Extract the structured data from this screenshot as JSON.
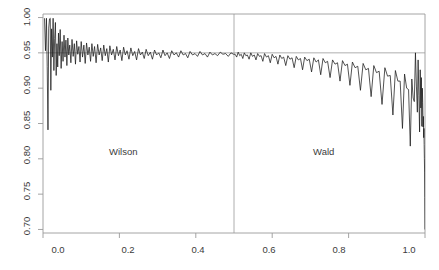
{
  "chart_data": {
    "type": "line",
    "title": "",
    "subtitle": "",
    "xlabel": "",
    "ylabel": "",
    "xlim": [
      0.0,
      1.0
    ],
    "ylim": [
      0.695,
      1.005
    ],
    "grid": false,
    "legend_position": "none",
    "xticks": [
      0.0,
      0.2,
      0.4,
      0.6,
      0.8,
      1.0
    ],
    "xtick_labels": [
      "0.0",
      "0.2",
      "0.4",
      "0.6",
      "0.8",
      "1.0"
    ],
    "yticks": [
      0.7,
      0.75,
      0.8,
      0.85,
      0.9,
      0.95,
      1.0
    ],
    "ytick_labels": [
      "0.70",
      "0.75",
      "0.80",
      "0.85",
      "0.90",
      "0.95",
      "1.00"
    ],
    "reference_lines": [
      {
        "orientation": "horizontal",
        "value": 0.95,
        "color": "#999999"
      },
      {
        "orientation": "vertical",
        "value": 0.5,
        "color": "#999999"
      }
    ],
    "annotations": [
      {
        "text": "Wilson",
        "x": 0.21,
        "y": 0.805
      },
      {
        "text": "Wald",
        "x": 0.735,
        "y": 0.805
      }
    ],
    "series": [
      {
        "name": "coverage",
        "color": "#1a1a1a",
        "x": [
          0.004,
          0.0065,
          0.009,
          0.011,
          0.013,
          0.015,
          0.017,
          0.019,
          0.0205,
          0.0225,
          0.0245,
          0.0265,
          0.0285,
          0.0305,
          0.0325,
          0.0345,
          0.0365,
          0.0385,
          0.0405,
          0.0425,
          0.045,
          0.0475,
          0.05,
          0.0525,
          0.055,
          0.0575,
          0.06,
          0.0625,
          0.065,
          0.0675,
          0.07,
          0.073,
          0.076,
          0.079,
          0.082,
          0.085,
          0.088,
          0.091,
          0.094,
          0.097,
          0.1,
          0.1035,
          0.107,
          0.1105,
          0.114,
          0.1175,
          0.121,
          0.1245,
          0.128,
          0.1315,
          0.135,
          0.139,
          0.143,
          0.147,
          0.151,
          0.155,
          0.159,
          0.163,
          0.167,
          0.171,
          0.175,
          0.1795,
          0.184,
          0.1885,
          0.193,
          0.1975,
          0.202,
          0.2065,
          0.211,
          0.2155,
          0.22,
          0.225,
          0.23,
          0.235,
          0.24,
          0.245,
          0.25,
          0.255,
          0.26,
          0.265,
          0.27,
          0.2755,
          0.281,
          0.2865,
          0.292,
          0.2975,
          0.303,
          0.3085,
          0.314,
          0.3195,
          0.325,
          0.331,
          0.337,
          0.343,
          0.349,
          0.355,
          0.361,
          0.367,
          0.373,
          0.379,
          0.385,
          0.3915,
          0.398,
          0.4045,
          0.411,
          0.4175,
          0.424,
          0.4305,
          0.437,
          0.4435,
          0.45,
          0.457,
          0.464,
          0.471,
          0.478,
          0.485,
          0.492,
          0.499,
          0.503,
          0.507,
          0.511,
          0.515,
          0.519,
          0.523,
          0.527,
          0.531,
          0.535,
          0.5395,
          0.544,
          0.5485,
          0.553,
          0.5575,
          0.562,
          0.5665,
          0.571,
          0.5755,
          0.58,
          0.585,
          0.59,
          0.595,
          0.6,
          0.605,
          0.61,
          0.615,
          0.62,
          0.625,
          0.63,
          0.6355,
          0.641,
          0.6465,
          0.652,
          0.6575,
          0.663,
          0.6685,
          0.674,
          0.6795,
          0.685,
          0.691,
          0.697,
          0.703,
          0.709,
          0.715,
          0.721,
          0.727,
          0.733,
          0.739,
          0.745,
          0.7515,
          0.758,
          0.7645,
          0.771,
          0.7775,
          0.784,
          0.7905,
          0.797,
          0.8035,
          0.81,
          0.817,
          0.824,
          0.831,
          0.838,
          0.845,
          0.852,
          0.859,
          0.866,
          0.873,
          0.88,
          0.8875,
          0.895,
          0.902,
          0.909,
          0.916,
          0.9225,
          0.929,
          0.935,
          0.941,
          0.9465,
          0.952,
          0.957,
          0.9615,
          0.9655,
          0.969,
          0.972,
          0.975,
          0.9775,
          0.98,
          0.982,
          0.984,
          0.9858,
          0.9875,
          0.989,
          0.9905,
          0.9918,
          0.993,
          0.994,
          0.995,
          0.9958,
          0.9965,
          0.9972,
          0.9978,
          0.9984,
          0.999,
          0.9995,
          1.0
        ],
        "values": [
          0.999,
          0.953,
          0.999,
          0.931,
          0.841,
          0.985,
          0.998,
          0.999,
          0.897,
          0.984,
          0.944,
          0.999,
          0.925,
          0.97,
          0.993,
          0.918,
          0.963,
          0.93,
          0.978,
          0.946,
          0.983,
          0.928,
          0.966,
          0.938,
          0.975,
          0.944,
          0.968,
          0.932,
          0.971,
          0.947,
          0.961,
          0.936,
          0.969,
          0.945,
          0.963,
          0.934,
          0.967,
          0.948,
          0.959,
          0.937,
          0.966,
          0.944,
          0.961,
          0.935,
          0.964,
          0.947,
          0.958,
          0.938,
          0.963,
          0.945,
          0.959,
          0.936,
          0.962,
          0.947,
          0.957,
          0.939,
          0.961,
          0.946,
          0.956,
          0.937,
          0.96,
          0.947,
          0.955,
          0.94,
          0.959,
          0.946,
          0.954,
          0.939,
          0.958,
          0.947,
          0.953,
          0.941,
          0.957,
          0.946,
          0.952,
          0.94,
          0.956,
          0.947,
          0.951,
          0.942,
          0.955,
          0.946,
          0.951,
          0.941,
          0.954,
          0.947,
          0.95,
          0.943,
          0.954,
          0.946,
          0.95,
          0.942,
          0.953,
          0.947,
          0.95,
          0.944,
          0.953,
          0.947,
          0.949,
          0.943,
          0.952,
          0.947,
          0.949,
          0.945,
          0.952,
          0.947,
          0.949,
          0.944,
          0.951,
          0.947,
          0.949,
          0.946,
          0.951,
          0.948,
          0.949,
          0.945,
          0.95,
          0.948,
          0.948,
          0.944,
          0.951,
          0.946,
          0.948,
          0.942,
          0.95,
          0.946,
          0.947,
          0.941,
          0.95,
          0.945,
          0.947,
          0.94,
          0.949,
          0.945,
          0.946,
          0.938,
          0.949,
          0.944,
          0.946,
          0.936,
          0.948,
          0.943,
          0.945,
          0.934,
          0.947,
          0.942,
          0.944,
          0.932,
          0.946,
          0.941,
          0.943,
          0.929,
          0.945,
          0.94,
          0.942,
          0.926,
          0.944,
          0.939,
          0.941,
          0.923,
          0.943,
          0.937,
          0.94,
          0.919,
          0.942,
          0.936,
          0.938,
          0.915,
          0.94,
          0.934,
          0.936,
          0.91,
          0.939,
          0.932,
          0.934,
          0.904,
          0.937,
          0.929,
          0.931,
          0.897,
          0.935,
          0.926,
          0.928,
          0.888,
          0.932,
          0.922,
          0.924,
          0.877,
          0.929,
          0.917,
          0.918,
          0.862,
          0.925,
          0.91,
          0.91,
          0.843,
          0.92,
          0.9,
          0.898,
          0.818,
          0.913,
          0.886,
          0.881,
          0.95,
          0.903,
          0.866,
          0.94,
          0.89,
          0.838,
          0.926,
          0.872,
          0.915,
          0.846,
          0.9,
          0.88,
          0.845,
          0.86,
          0.83,
          0.843,
          0.82,
          0.8,
          0.78,
          0.745,
          0.7
        ]
      }
    ]
  },
  "axes": {
    "ytick_labels": [
      "1.00",
      "0.95",
      "0.90",
      "0.85",
      "0.80",
      "0.75",
      "0.70"
    ],
    "xtick_labels": [
      "0.0",
      "0.2",
      "0.4",
      "0.6",
      "0.8",
      "1.0"
    ]
  },
  "labels": {
    "left_panel": "Wilson",
    "right_panel": "Wald"
  }
}
